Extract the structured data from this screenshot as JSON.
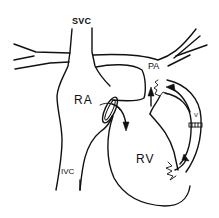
{
  "diagram": {
    "type": "anatomical line drawing",
    "labels": {
      "svc": "SVC",
      "pa": "PA",
      "ra": "RA",
      "rv": "RV",
      "ivc": "IVC",
      "valve": "V"
    },
    "structures": [
      {
        "id": "svc",
        "name": "superior vena cava"
      },
      {
        "id": "ivc",
        "name": "inferior vena cava"
      },
      {
        "id": "ra",
        "name": "right atrium"
      },
      {
        "id": "rv",
        "name": "right ventricle"
      },
      {
        "id": "pa",
        "name": "pulmonary artery"
      },
      {
        "id": "conduit",
        "name": "valved conduit from RV to PA"
      },
      {
        "id": "tricuspid-valve",
        "name": "atrioventricular valve between RA and RV"
      }
    ],
    "arrows": [
      {
        "id": "ra-to-rv",
        "description": "flow from RA through valve into RV"
      },
      {
        "id": "up-to-pa",
        "description": "upward arrow toward PA below its origin"
      },
      {
        "id": "conduit-flow-upper",
        "description": "flow in conduit toward PA"
      },
      {
        "id": "conduit-flow-lower",
        "description": "flow from RV into conduit"
      }
    ],
    "colors": {
      "line": "#111111",
      "background": "#ffffff"
    }
  }
}
